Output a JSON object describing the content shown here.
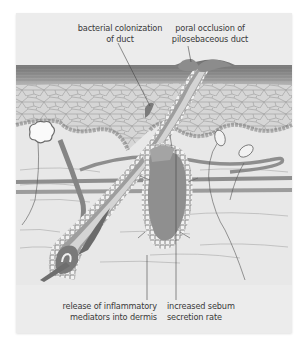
{
  "diagram": {
    "colors": {
      "background": "#ececec",
      "dermis": "#e6e6e6",
      "epidermis_cells": "#d8d8d8",
      "stratum_corneum": "#8a8a8a",
      "duct": "#d7d7d7",
      "gland": "#8f8f8f",
      "plug": "#8c8c8c",
      "vessel": "#9a9a9a",
      "text": "#3a3a3a"
    },
    "labels": {
      "bacterial": {
        "line1": "bacterial colonization",
        "line2": "of duct"
      },
      "poral": {
        "line1": "poral occlusion of",
        "line2": "pilosebaceous duct"
      },
      "inflammatory": {
        "line1": "release of inflammatory",
        "line2": "mediators into dermis"
      },
      "sebum": {
        "line1": "increased sebum",
        "line2": "secretion rate"
      }
    },
    "structures": [
      "stratum-corneum",
      "epidermis",
      "dermis",
      "pilosebaceous-duct",
      "keratin-plug",
      "sebaceous-gland",
      "hair-follicle",
      "hair-bulb",
      "sweat-gland",
      "pacinian-corpuscles",
      "blood-vessels",
      "nerve-fibers",
      "arrector-pili-muscle"
    ]
  }
}
